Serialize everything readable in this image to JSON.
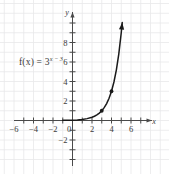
{
  "figure": {
    "kind": "coordinate-plane-graph",
    "background_color": "#ffffff",
    "grid_color": "#e8e8ea",
    "axis_color": "#4a4a4a",
    "curve_color": "#1a1a1a"
  },
  "labels": {
    "function_expression": "f(x) = 3",
    "function_exponent": "x − 3",
    "function_full": "f(x) = 3^(x-3)",
    "x_axis_name": "x",
    "y_axis_name": "y"
  },
  "chart_data": {
    "type": "line",
    "title": "",
    "subtitle": "",
    "xlabel": "x",
    "ylabel": "y",
    "grid": true,
    "legend": "none",
    "annotations": [
      "f(x) = 3^(x-3)"
    ],
    "xlim": [
      -8,
      8
    ],
    "ylim": [
      -3.5,
      11
    ],
    "x_tick_interval": 1,
    "x_tick_labels": [
      "-6",
      "-4",
      "-2",
      "0",
      "2",
      "4",
      "6"
    ],
    "x_tick_label_values": [
      -6,
      -4,
      -2,
      0,
      2,
      4,
      6
    ],
    "y_tick_interval": 1,
    "y_tick_labels": [
      "-2",
      "2",
      "4",
      "6",
      "8"
    ],
    "y_tick_label_values": [
      -2,
      2,
      4,
      6,
      8
    ],
    "series": [
      {
        "name": "f(x) = 3^(x-3)",
        "equation": "y = 3^(x-3)",
        "color": "#1a1a1a",
        "arrow_end": "up-right",
        "x": [
          -1.0,
          0.0,
          0.5,
          1.0,
          1.5,
          2.0,
          2.25,
          2.5,
          2.75,
          3.0,
          3.25,
          3.5,
          3.75,
          4.0,
          4.25,
          4.5,
          4.75,
          5.0,
          5.1
        ],
        "y": [
          0.0137,
          0.037,
          0.064,
          0.111,
          0.192,
          0.333,
          0.438,
          0.577,
          0.76,
          1.0,
          1.316,
          1.732,
          2.28,
          3.0,
          3.948,
          5.196,
          6.839,
          9.0,
          10.05
        ]
      }
    ],
    "marked_points": [
      {
        "x": 3,
        "y": 1,
        "label": ""
      },
      {
        "x": 4,
        "y": 3,
        "label": ""
      }
    ]
  }
}
